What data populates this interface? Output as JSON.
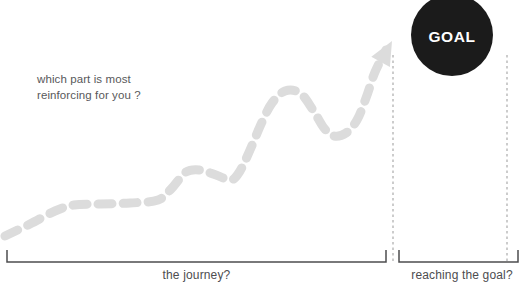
{
  "canvas": {
    "width": 528,
    "height": 291,
    "background": "#ffffff"
  },
  "annotation": {
    "question": "which part is most\nreinforcing for you ?",
    "color": "#58585a"
  },
  "goal": {
    "label": "GOAL",
    "circle_color": "#1b1b1b",
    "text_color": "#ffffff"
  },
  "brackets": [
    {
      "id": "journey",
      "label": "the journey?",
      "color": "#4d4d4f"
    },
    {
      "id": "reaching-goal",
      "label": "reaching the goal?",
      "color": "#4d4d4f"
    }
  ],
  "chart_data": {
    "type": "line",
    "title": "",
    "xlabel": "",
    "ylabel": "",
    "style": "dashed-progress-arrow",
    "line_color": "#dcdcdc",
    "line_width": 9,
    "dash_pattern": "14 11",
    "arrowhead": true,
    "grid": false,
    "legend": false,
    "xlim": [
      0,
      528
    ],
    "ylim": [
      291,
      0
    ],
    "series": [
      {
        "name": "progress",
        "comment": "pixel-space control points of the hand-drawn dashed journey curve, left to right",
        "points": [
          [
            5,
            236
          ],
          [
            30,
            224
          ],
          [
            55,
            211
          ],
          [
            74,
            205
          ],
          [
            100,
            204
          ],
          [
            130,
            203
          ],
          [
            158,
            200
          ],
          [
            172,
            188
          ],
          [
            186,
            172
          ],
          [
            200,
            170
          ],
          [
            216,
            175
          ],
          [
            231,
            180
          ],
          [
            240,
            171
          ],
          [
            250,
            150
          ],
          [
            262,
            122
          ],
          [
            272,
            103
          ],
          [
            285,
            91
          ],
          [
            300,
            93
          ],
          [
            313,
            110
          ],
          [
            324,
            128
          ],
          [
            334,
            136
          ],
          [
            346,
            133
          ],
          [
            357,
            120
          ],
          [
            366,
            98
          ],
          [
            375,
            72
          ],
          [
            386,
            50
          ]
        ],
        "arrow_tip": [
          392,
          41
        ]
      }
    ],
    "dividers": [
      {
        "name": "journey-end-divider",
        "x": 393,
        "y_top": 55,
        "y_bottom": 262,
        "style": "dotted",
        "color": "#b7b7b7"
      },
      {
        "name": "goal-end-divider",
        "x": 507,
        "y_top": 55,
        "y_bottom": 262,
        "style": "dotted",
        "color": "#b7b7b7"
      }
    ],
    "bracket_geometry": [
      {
        "name": "journey-bracket",
        "x_start": 7,
        "x_end": 386,
        "y": 262,
        "tick_height": 12
      },
      {
        "name": "reaching-goal-bracket",
        "x_start": 399,
        "x_end": 518,
        "y": 262,
        "tick_height": 12
      }
    ]
  }
}
